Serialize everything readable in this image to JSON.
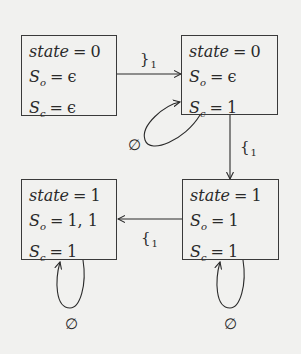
{
  "diagram": {
    "states": [
      {
        "id": "top-left",
        "state_var": "state",
        "state_val": "0",
        "so_var": "S",
        "so_sub": "o",
        "so_val": "ϵ",
        "sc_var": "S",
        "sc_sub": "c",
        "sc_val": "ϵ"
      },
      {
        "id": "top-right",
        "state_var": "state",
        "state_val": "0",
        "so_var": "S",
        "so_sub": "o",
        "so_val": "ϵ",
        "sc_var": "S",
        "sc_sub": "c",
        "sc_val": "1"
      },
      {
        "id": "bottom-left",
        "state_var": "state",
        "state_val": "1",
        "so_var": "S",
        "so_sub": "o",
        "so_val": "1, 1",
        "sc_var": "S",
        "sc_sub": "c",
        "sc_val": "1"
      },
      {
        "id": "bottom-right",
        "state_var": "state",
        "state_val": "1",
        "so_var": "S",
        "so_sub": "o",
        "so_val": "1",
        "sc_var": "S",
        "sc_sub": "c",
        "sc_val": "1"
      }
    ],
    "equals": "=",
    "transitions": [
      {
        "from": "top-left",
        "to": "top-right",
        "symbol": "}",
        "subscript": "1"
      },
      {
        "from": "top-right",
        "to": "bottom-right",
        "symbol": "{",
        "subscript": "1"
      },
      {
        "from": "bottom-right",
        "to": "bottom-left",
        "symbol": "{",
        "subscript": "1"
      },
      {
        "from": "top-right",
        "to": "top-right",
        "symbol": "∅",
        "subscript": ""
      },
      {
        "from": "bottom-left",
        "to": "bottom-left",
        "symbol": "∅",
        "subscript": ""
      },
      {
        "from": "bottom-right",
        "to": "bottom-right",
        "symbol": "∅",
        "subscript": ""
      }
    ],
    "colors": {
      "background": "#f1f1ef",
      "ink": "#2a2a2a"
    }
  }
}
